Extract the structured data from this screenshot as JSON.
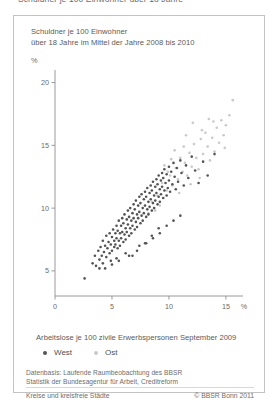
{
  "page": {
    "header_strip_text": "Schuldner je 100 Einwohner über 18 Jahre"
  },
  "title": {
    "line1": "Schuldner je 100 Einwohner",
    "line2": "über 18 Jahre im Mittel der Jahre 2008 bis 2010"
  },
  "legend": {
    "items": [
      {
        "label": "West",
        "color": "#545454"
      },
      {
        "label": "Ost",
        "color": "#c9c9c9"
      }
    ]
  },
  "source": {
    "line1": "Datenbasis: Laufende Raumbeobachtung des BBSR",
    "line2": "Statistik der Bundesagentur für Arbeit, Creditreform"
  },
  "footer": {
    "left": "Kreise und kreisfreie Städte",
    "right": "© BBSR Bonn 2011"
  },
  "chart_data": {
    "type": "scatter",
    "title": "Schuldner je 100 Einwohner über 18 Jahre im Mittel der Jahre 2008 bis 2010",
    "xlabel": "Arbeitslose je 100 zivile Erwerbspersonen September 2009",
    "ylabel": "Schuldner je 100 Einwohner über 18 Jahre",
    "x_unit": "%",
    "y_unit": "%",
    "xlim": [
      0,
      16.5
    ],
    "ylim": [
      3.0,
      21.0
    ],
    "xticks": [
      0,
      5,
      10,
      15
    ],
    "yticks": [
      5,
      10,
      15,
      20
    ],
    "xtick_labels": [
      "0",
      "5",
      "10",
      "15"
    ],
    "ytick_labels": [
      "5",
      "10",
      "15",
      "20"
    ],
    "grid": false,
    "legend_position": "below-axis-left",
    "marker_size_px": 2.6,
    "series": [
      {
        "name": "West",
        "color": "#545454",
        "points": [
          [
            2.6,
            4.4
          ],
          [
            3.3,
            5.6
          ],
          [
            3.5,
            6.2
          ],
          [
            3.6,
            5.4
          ],
          [
            3.8,
            6.6
          ],
          [
            3.9,
            5.9
          ],
          [
            4.0,
            6.9
          ],
          [
            4.1,
            6.2
          ],
          [
            4.2,
            7.4
          ],
          [
            4.3,
            6.5
          ],
          [
            4.4,
            7.0
          ],
          [
            4.5,
            6.1
          ],
          [
            4.5,
            7.8
          ],
          [
            4.6,
            6.8
          ],
          [
            4.7,
            7.3
          ],
          [
            4.8,
            6.4
          ],
          [
            4.8,
            8.0
          ],
          [
            4.9,
            7.1
          ],
          [
            5.0,
            7.7
          ],
          [
            5.0,
            6.6
          ],
          [
            5.1,
            8.3
          ],
          [
            5.2,
            7.4
          ],
          [
            5.2,
            6.9
          ],
          [
            5.3,
            8.0
          ],
          [
            5.3,
            7.1
          ],
          [
            5.4,
            8.6
          ],
          [
            5.4,
            7.6
          ],
          [
            5.5,
            6.8
          ],
          [
            5.5,
            8.2
          ],
          [
            5.6,
            7.4
          ],
          [
            5.6,
            9.0
          ],
          [
            5.7,
            8.0
          ],
          [
            5.7,
            7.0
          ],
          [
            5.8,
            8.6
          ],
          [
            5.8,
            7.6
          ],
          [
            5.9,
            9.2
          ],
          [
            5.9,
            8.1
          ],
          [
            6.0,
            7.3
          ],
          [
            6.0,
            8.8
          ],
          [
            6.1,
            7.9
          ],
          [
            6.1,
            9.5
          ],
          [
            6.2,
            8.4
          ],
          [
            6.2,
            7.5
          ],
          [
            6.3,
            9.1
          ],
          [
            6.3,
            8.1
          ],
          [
            6.4,
            9.8
          ],
          [
            6.4,
            8.7
          ],
          [
            6.5,
            7.8
          ],
          [
            6.5,
            9.3
          ],
          [
            6.6,
            8.4
          ],
          [
            6.6,
            10.0
          ],
          [
            6.7,
            9.0
          ],
          [
            6.7,
            8.0
          ],
          [
            6.8,
            9.6
          ],
          [
            6.8,
            8.6
          ],
          [
            6.9,
            10.3
          ],
          [
            6.9,
            9.2
          ],
          [
            7.0,
            8.3
          ],
          [
            7.0,
            9.9
          ],
          [
            7.1,
            8.9
          ],
          [
            7.1,
            10.6
          ],
          [
            7.2,
            9.5
          ],
          [
            7.2,
            8.5
          ],
          [
            7.3,
            10.2
          ],
          [
            7.3,
            9.2
          ],
          [
            7.4,
            10.9
          ],
          [
            7.4,
            9.7
          ],
          [
            7.5,
            8.8
          ],
          [
            7.5,
            10.4
          ],
          [
            7.6,
            9.4
          ],
          [
            7.6,
            11.1
          ],
          [
            7.7,
            10.0
          ],
          [
            7.7,
            9.0
          ],
          [
            7.8,
            10.7
          ],
          [
            7.8,
            9.6
          ],
          [
            7.9,
            11.3
          ],
          [
            7.9,
            10.2
          ],
          [
            8.0,
            9.3
          ],
          [
            8.0,
            10.9
          ],
          [
            8.1,
            9.9
          ],
          [
            8.1,
            11.6
          ],
          [
            8.2,
            10.5
          ],
          [
            8.2,
            9.5
          ],
          [
            8.3,
            11.2
          ],
          [
            8.3,
            10.1
          ],
          [
            8.4,
            11.8
          ],
          [
            8.4,
            10.7
          ],
          [
            8.5,
            9.8
          ],
          [
            8.5,
            11.4
          ],
          [
            8.6,
            10.4
          ],
          [
            8.6,
            12.1
          ],
          [
            8.7,
            11.0
          ],
          [
            8.7,
            10.0
          ],
          [
            8.8,
            11.7
          ],
          [
            8.8,
            10.6
          ],
          [
            8.9,
            12.3
          ],
          [
            8.9,
            11.2
          ],
          [
            9.0,
            10.3
          ],
          [
            9.0,
            11.9
          ],
          [
            9.1,
            10.9
          ],
          [
            9.1,
            12.6
          ],
          [
            9.2,
            11.5
          ],
          [
            9.2,
            10.5
          ],
          [
            9.3,
            12.2
          ],
          [
            9.3,
            11.1
          ],
          [
            9.4,
            12.8
          ],
          [
            9.4,
            11.7
          ],
          [
            9.5,
            10.8
          ],
          [
            9.5,
            12.4
          ],
          [
            9.6,
            11.4
          ],
          [
            9.6,
            13.1
          ],
          [
            9.7,
            12.0
          ],
          [
            9.8,
            11.0
          ],
          [
            9.8,
            12.7
          ],
          [
            9.9,
            11.6
          ],
          [
            10.0,
            13.3
          ],
          [
            10.0,
            12.2
          ],
          [
            10.1,
            11.3
          ],
          [
            10.2,
            12.9
          ],
          [
            10.3,
            11.9
          ],
          [
            10.4,
            13.6
          ],
          [
            10.5,
            12.5
          ],
          [
            10.6,
            11.5
          ],
          [
            10.7,
            13.2
          ],
          [
            10.8,
            12.1
          ],
          [
            11.0,
            13.8
          ],
          [
            11.1,
            12.8
          ],
          [
            11.3,
            11.8
          ],
          [
            11.5,
            13.4
          ],
          [
            11.7,
            12.4
          ],
          [
            12.0,
            14.1
          ],
          [
            12.3,
            13.0
          ],
          [
            12.6,
            12.0
          ],
          [
            13.0,
            13.7
          ],
          [
            13.4,
            12.6
          ],
          [
            14.0,
            14.3
          ],
          [
            4.4,
            5.2
          ],
          [
            5.0,
            5.5
          ],
          [
            5.6,
            5.8
          ],
          [
            6.2,
            6.4
          ],
          [
            6.8,
            6.2
          ],
          [
            7.4,
            7.0
          ],
          [
            8.0,
            7.2
          ],
          [
            8.6,
            7.6
          ],
          [
            9.2,
            8.0
          ],
          [
            9.8,
            8.6
          ],
          [
            10.4,
            9.0
          ],
          [
            11.0,
            9.4
          ],
          [
            6.5,
            6.2
          ],
          [
            7.2,
            6.6
          ],
          [
            7.9,
            7.2
          ],
          [
            8.5,
            7.8
          ],
          [
            9.1,
            8.4
          ],
          [
            5.4,
            6.0
          ],
          [
            4.9,
            5.8
          ],
          [
            4.2,
            5.6
          ],
          [
            3.9,
            5.2
          ]
        ]
      },
      {
        "name": "Ost",
        "color": "#c9c9c9",
        "points": [
          [
            8.5,
            10.5
          ],
          [
            9.0,
            11.0
          ],
          [
            9.4,
            12.0
          ],
          [
            9.8,
            11.4
          ],
          [
            10.1,
            12.6
          ],
          [
            10.3,
            11.8
          ],
          [
            10.6,
            13.2
          ],
          [
            10.8,
            12.3
          ],
          [
            11.0,
            14.0
          ],
          [
            11.2,
            12.9
          ],
          [
            11.4,
            13.6
          ],
          [
            11.6,
            12.6
          ],
          [
            11.8,
            14.4
          ],
          [
            12.0,
            13.3
          ],
          [
            12.2,
            15.1
          ],
          [
            12.4,
            14.0
          ],
          [
            12.6,
            13.1
          ],
          [
            12.8,
            15.5
          ],
          [
            13.0,
            14.3
          ],
          [
            13.2,
            16.0
          ],
          [
            13.4,
            14.9
          ],
          [
            13.6,
            13.8
          ],
          [
            13.8,
            15.6
          ],
          [
            14.0,
            14.5
          ],
          [
            14.2,
            16.4
          ],
          [
            14.4,
            15.2
          ],
          [
            14.6,
            17.0
          ],
          [
            14.8,
            15.8
          ],
          [
            15.0,
            16.6
          ],
          [
            15.3,
            17.4
          ],
          [
            15.6,
            18.6
          ],
          [
            12.1,
            16.8
          ],
          [
            13.5,
            17.1
          ],
          [
            11.5,
            15.8
          ],
          [
            10.5,
            14.6
          ],
          [
            9.6,
            13.4
          ],
          [
            11.9,
            11.9
          ],
          [
            12.7,
            12.4
          ],
          [
            10.9,
            11.2
          ],
          [
            9.2,
            10.2
          ],
          [
            13.9,
            16.9
          ],
          [
            14.9,
            14.8
          ],
          [
            8.8,
            9.8
          ],
          [
            8.2,
            9.6
          ],
          [
            12.9,
            16.2
          ],
          [
            11.3,
            14.9
          ],
          [
            10.2,
            13.9
          ],
          [
            9.9,
            12.9
          ]
        ]
      }
    ]
  }
}
